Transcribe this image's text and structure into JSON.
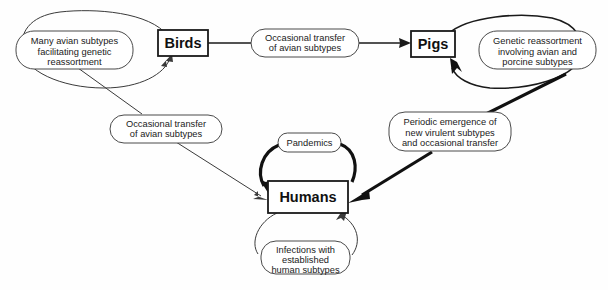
{
  "diagram": {
    "background_color": "#fefefe",
    "line_color": "#1a1a1a",
    "nodes": [
      {
        "id": "birds",
        "label": "Birds"
      },
      {
        "id": "pigs",
        "label": "Pigs"
      },
      {
        "id": "humans",
        "label": "Humans"
      }
    ],
    "annotations": {
      "birds_loop": {
        "line1": "Many avian subtypes",
        "line2": "facilitating genetic",
        "line3": "reassortment"
      },
      "birds_to_pigs": {
        "line1": "Occasional transfer",
        "line2": "of avian subtypes"
      },
      "birds_to_humans": {
        "line1": "Occasional transfer",
        "line2": "of avian subtypes"
      },
      "pigs_loop": {
        "line1": "Genetic reassortment",
        "line2": "involving avian and",
        "line3": "porcine subtypes"
      },
      "pigs_to_humans": {
        "line1": "Periodic emergence of",
        "line2": "new virulent subtypes",
        "line3": "and occasional transfer"
      },
      "pandemics": {
        "line1": "Pandemics"
      },
      "humans_loop": {
        "line1": "Infections with",
        "line2": "established",
        "line3": "human subtypes"
      }
    }
  }
}
